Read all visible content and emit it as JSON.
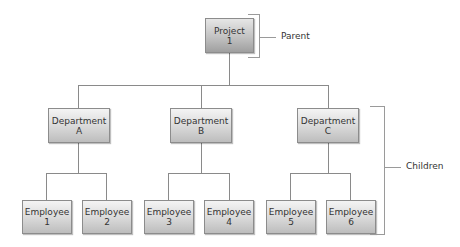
{
  "root": {
    "line1": "Project",
    "line2": "1"
  },
  "departments": [
    {
      "line1": "Department",
      "line2": "A"
    },
    {
      "line1": "Department",
      "line2": "B"
    },
    {
      "line1": "Department",
      "line2": "C"
    }
  ],
  "employees": [
    {
      "line1": "Employee",
      "line2": "1"
    },
    {
      "line1": "Employee",
      "line2": "2"
    },
    {
      "line1": "Employee",
      "line2": "3"
    },
    {
      "line1": "Employee",
      "line2": "4"
    },
    {
      "line1": "Employee",
      "line2": "5"
    },
    {
      "line1": "Employee",
      "line2": "6"
    }
  ],
  "annotations": {
    "parent": "Parent",
    "children": "Children"
  }
}
